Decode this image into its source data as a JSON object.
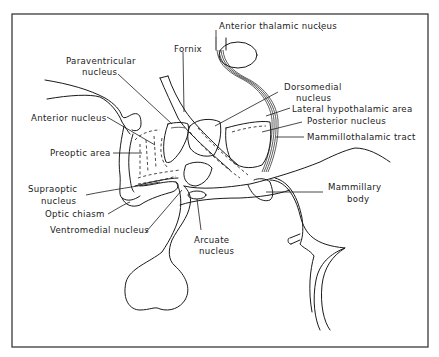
{
  "diagram": {
    "type": "anatomical-line-drawing",
    "labels": {
      "paraventricular": [
        "Paraventricular",
        "nucleus"
      ],
      "fornix": "Fornix",
      "anterior_thalamic": "Anterior thalamic nucleus",
      "dorsomedial": [
        "Dorsomedial",
        "nucleus"
      ],
      "lateral_hypothalamic": "Lateral hypothalamic area",
      "posterior": "Posterior nucleus",
      "mammillothalamic": "Mammillothalamic tract",
      "anterior": "Anterior nucleus",
      "preoptic": "Preoptic area",
      "supraoptic": [
        "Supraoptic",
        "nucleus"
      ],
      "optic_chiasm": "Optic chiasm",
      "ventromedial": "Ventromedial nucleus",
      "mammillary": [
        "Mammillary",
        "body"
      ],
      "arcuate": [
        "Arcuate",
        "nucleus"
      ]
    },
    "colors": {
      "ink": "#1a1a1a",
      "frame": "#3a3a3a",
      "background": "#ffffff"
    }
  }
}
